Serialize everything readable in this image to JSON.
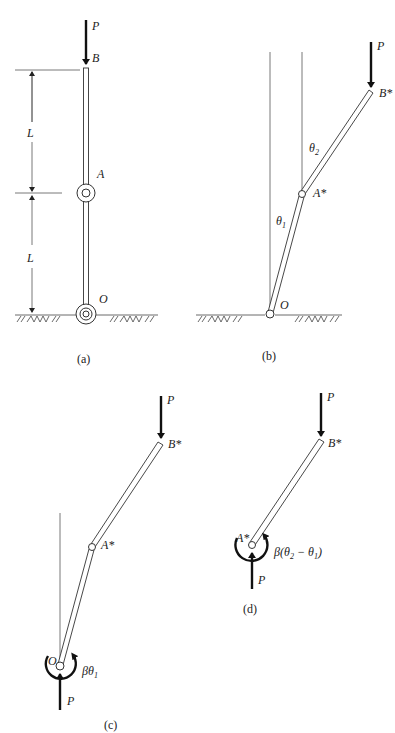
{
  "figure": {
    "panels": [
      {
        "id": "a",
        "caption": "(a)",
        "labels": {
          "load": "P",
          "top": "B",
          "mid": "A",
          "base": "O",
          "dim_upper": "L",
          "dim_lower": "L"
        }
      },
      {
        "id": "b",
        "caption": "(b)",
        "labels": {
          "load": "P",
          "top": "B*",
          "mid": "A*",
          "base": "O",
          "angle_upper": "θ",
          "angle_upper_sub": "2",
          "angle_lower": "θ",
          "angle_lower_sub": "1"
        }
      },
      {
        "id": "c",
        "caption": "(c)",
        "labels": {
          "load_top": "P",
          "top": "B*",
          "mid": "A*",
          "base": "O",
          "load_bottom": "P",
          "moment": "βθ",
          "moment_sub": "1"
        }
      },
      {
        "id": "d",
        "caption": "(d)",
        "labels": {
          "load_top": "P",
          "top": "B*",
          "base": "A*",
          "load_bottom": "P",
          "moment_prefix": "β(θ",
          "moment_sub_a": "2",
          "moment_mid": " − θ",
          "moment_sub_b": "1",
          "moment_suffix": ")"
        }
      }
    ]
  }
}
